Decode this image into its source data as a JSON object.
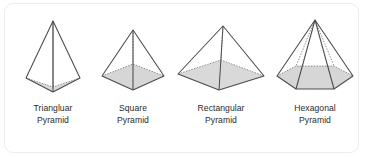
{
  "figure": {
    "background_color": "#ffffff",
    "border_color": "#ececec",
    "stroke_color": "#4a4a4a",
    "base_fill_color": "#d6d6d6",
    "caption_color": "#2b2b2b",
    "items": [
      {
        "id": "triangular-pyramid",
        "shape": "triangular-pyramid",
        "base_sides": 3,
        "caption_line1": "Triangluar",
        "caption_line2": "Pyramid"
      },
      {
        "id": "square-pyramid",
        "shape": "square-pyramid",
        "base_sides": 4,
        "caption_line1": "Square",
        "caption_line2": "Pyramid"
      },
      {
        "id": "rectangular-pyramid",
        "shape": "rectangular-pyramid",
        "base_sides": 4,
        "caption_line1": "Rectangular",
        "caption_line2": "Pyramid"
      },
      {
        "id": "hexagonal-pyramid",
        "shape": "hexagonal-pyramid",
        "base_sides": 6,
        "caption_line1": "Hexagonal",
        "caption_line2": "Pyramid"
      }
    ]
  }
}
